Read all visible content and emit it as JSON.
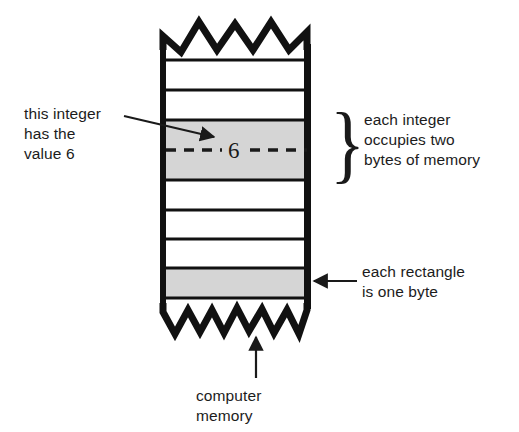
{
  "figure": {
    "title_text": "computer memory diagram",
    "memory_column": {
      "name": "computer-memory-column",
      "left": 163,
      "right": 310,
      "top_edge": 48,
      "bottom_edge": 305,
      "border_color": "#111111",
      "border_width": 6,
      "row_count": 9,
      "row_height": 30,
      "divider_color": "#111111",
      "divider_width": 3,
      "cell_fill": "#ffffff",
      "shaded_fill": "#d5d5d5",
      "shaded_rows": [
        2,
        3,
        7
      ],
      "torn_top": {
        "name": "torn-edge-top",
        "teeth": 4,
        "direction": "up"
      },
      "torn_bottom": {
        "name": "torn-edge-bottom",
        "teeth": 6,
        "direction": "down"
      }
    },
    "value_marker": {
      "name": "integer-value-marker",
      "digit": "6",
      "dashed_line_y": 150,
      "dash_color": "#1a1a1a"
    },
    "brace": {
      "name": "two-byte-brace",
      "glyph": "}",
      "spans_rows": [
        2,
        3
      ]
    }
  },
  "annotations": {
    "integer_value": {
      "name": "annotation-this-integer",
      "lines": [
        "this integer",
        "has the",
        "value 6"
      ],
      "text": "this integer\nhas the\nvalue 6",
      "arrow": "diagonal-arrow-right"
    },
    "each_integer": {
      "name": "annotation-each-integer",
      "lines": [
        "each integer",
        "occupies two",
        "bytes of memory"
      ],
      "text": "each integer\noccupies two\nbytes of memory"
    },
    "each_rectangle": {
      "name": "annotation-each-rectangle",
      "lines": [
        "each rectangle",
        "is one byte"
      ],
      "text": "each rectangle\nis one byte",
      "arrow": "arrow-left"
    },
    "computer_memory": {
      "name": "annotation-computer-memory",
      "lines": [
        "computer",
        "memory"
      ],
      "text": "computer\nmemory",
      "arrow": "arrow-up"
    }
  },
  "colors": {
    "ink": "#1a1a1a",
    "shade": "#d5d5d5",
    "page": "#ffffff"
  }
}
